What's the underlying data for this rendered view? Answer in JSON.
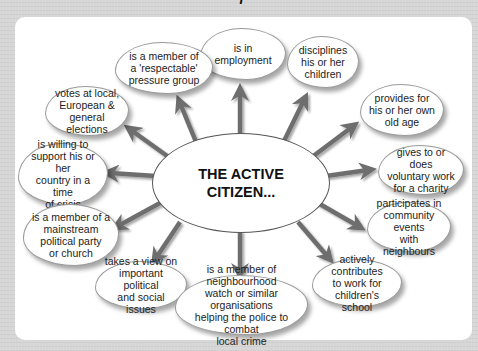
{
  "title_fragment": "(cut-off heading)",
  "colors": {
    "background": "#d6d6d6",
    "panel": "#ffffff",
    "arrow": "#6e6e6e",
    "bubble_border": "#9a9a9a",
    "text": "#222222"
  },
  "center": {
    "label": "THE ACTIVE\nCITIZEN..."
  },
  "bubbles": [
    {
      "id": "employment",
      "text": "is in\nemployment"
    },
    {
      "id": "pressure-group",
      "text": "is a member of\na 'respectable'\npressure group"
    },
    {
      "id": "votes",
      "text": "votes at local,\nEuropean &\ngeneral elections"
    },
    {
      "id": "support-country",
      "text": "is willing to\nsupport his or her\ncountry in a time\nof crisis"
    },
    {
      "id": "political-party",
      "text": "is a member of a\nmainstream\npolitical party\nor church"
    },
    {
      "id": "takes-view",
      "text": "takes a view on\nimportant political\nand social issues"
    },
    {
      "id": "neighbourhood-watch",
      "text": "is a member of neighbourhood\nwatch or similar organisations\nhelping the police to combat\nlocal crime"
    },
    {
      "id": "school",
      "text": "actively contributes\nto work for\nchildren's school"
    },
    {
      "id": "community-events",
      "text": "participates in\ncommunity events\nwith neighbours"
    },
    {
      "id": "charity",
      "text": "gives to or does\nvoluntary work\nfor a charity"
    },
    {
      "id": "old-age",
      "text": "provides for\nhis or her own\nold age"
    },
    {
      "id": "disciplines",
      "text": "disciplines\nhis or her\nchildren"
    }
  ]
}
